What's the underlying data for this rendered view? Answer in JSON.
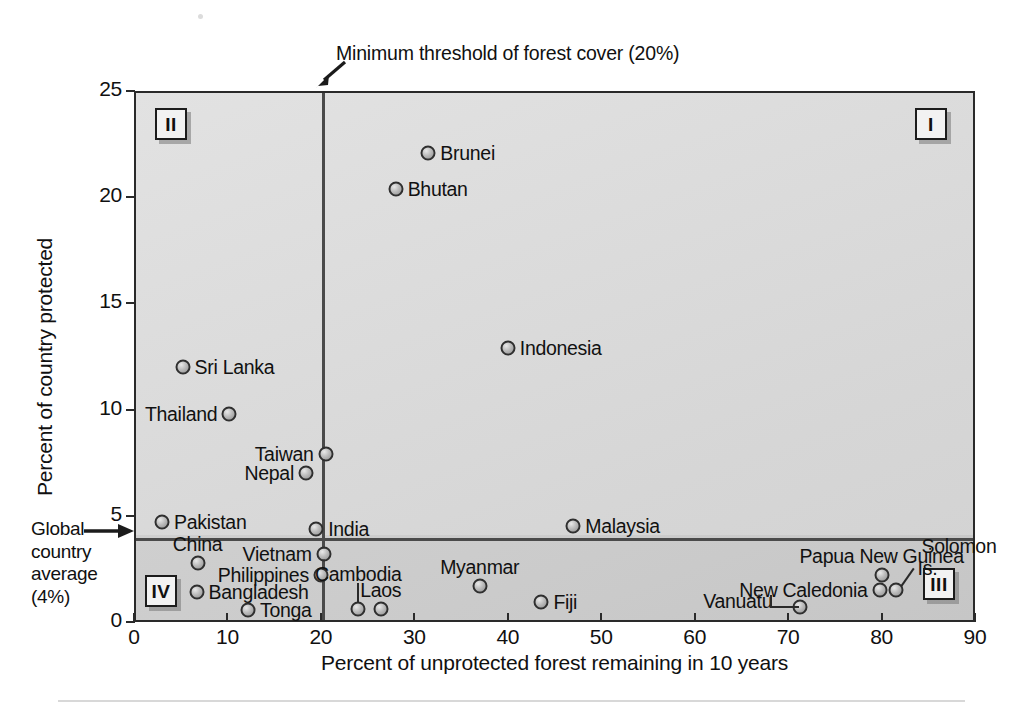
{
  "chart_data": {
    "type": "scatter",
    "title": "",
    "xlabel": "Percent of unprotected forest remaining in 10 years",
    "ylabel": "Percent of country protected",
    "xlim": [
      0,
      90
    ],
    "ylim": [
      0,
      25
    ],
    "xticks": [
      0,
      10,
      20,
      30,
      40,
      50,
      60,
      70,
      80,
      90
    ],
    "yticks": [
      0,
      5,
      10,
      15,
      20,
      25
    ],
    "grid": false,
    "legend": "none",
    "reference_lines": [
      {
        "name": "minimum-threshold-forest-cover",
        "orientation": "vertical",
        "value": 20,
        "label": "Minimum threshold of forest cover (20%)"
      },
      {
        "name": "global-country-average",
        "orientation": "horizontal",
        "value": 4,
        "label": "Global country average (4%)"
      }
    ],
    "quadrants": [
      {
        "id": "I",
        "label": "I"
      },
      {
        "id": "II",
        "label": "II"
      },
      {
        "id": "III",
        "label": "III"
      },
      {
        "id": "IV",
        "label": "IV"
      }
    ],
    "points": [
      {
        "name": "Brunei",
        "x": 31.5,
        "y": 22.1,
        "label_pos": "right"
      },
      {
        "name": "Bhutan",
        "x": 28.0,
        "y": 20.4,
        "label_pos": "right"
      },
      {
        "name": "Indonesia",
        "x": 40.0,
        "y": 12.9,
        "label_pos": "right"
      },
      {
        "name": "Sri Lanka",
        "x": 5.2,
        "y": 12.0,
        "label_pos": "right"
      },
      {
        "name": "Thailand",
        "x": 10.2,
        "y": 9.8,
        "label_pos": "left"
      },
      {
        "name": "Taiwan",
        "x": 20.5,
        "y": 7.9,
        "label_pos": "left"
      },
      {
        "name": "Nepal",
        "x": 18.4,
        "y": 7.0,
        "label_pos": "left"
      },
      {
        "name": "Malaysia",
        "x": 47.0,
        "y": 4.5,
        "label_pos": "right"
      },
      {
        "name": "Pakistan",
        "x": 3.0,
        "y": 4.7,
        "label_pos": "right"
      },
      {
        "name": "India",
        "x": 19.5,
        "y": 4.4,
        "label_pos": "right"
      },
      {
        "name": "China",
        "x": 6.8,
        "y": 2.8,
        "label_pos": "above"
      },
      {
        "name": "Vietnam",
        "x": 20.3,
        "y": 3.2,
        "label_pos": "left"
      },
      {
        "name": "Philippines",
        "x": 20.0,
        "y": 2.2,
        "label_pos": "left"
      },
      {
        "name": "Bangladesh",
        "x": 6.7,
        "y": 1.4,
        "label_pos": "right"
      },
      {
        "name": "Tonga",
        "x": 12.2,
        "y": 0.55,
        "label_pos": "right"
      },
      {
        "name": "Cambodia",
        "x": 24.0,
        "y": 0.6,
        "label_pos": "leader-up"
      },
      {
        "name": "Laos",
        "x": 26.4,
        "y": 0.6,
        "label_pos": "above"
      },
      {
        "name": "Myanmar",
        "x": 37.0,
        "y": 1.7,
        "label_pos": "above"
      },
      {
        "name": "Fiji",
        "x": 43.6,
        "y": 0.95,
        "label_pos": "right"
      },
      {
        "name": "Papua New Guinea",
        "x": 80.0,
        "y": 2.2,
        "label_pos": "above"
      },
      {
        "name": "New Caledonia",
        "x": 79.8,
        "y": 1.5,
        "label_pos": "left"
      },
      {
        "name": "Solomon Is.",
        "x": 81.5,
        "y": 1.5,
        "label_pos": "leader-up-right"
      },
      {
        "name": "Vanuatu",
        "x": 71.3,
        "y": 0.7,
        "label_pos": "leader-left"
      }
    ]
  },
  "axis": {
    "xlabel": "Percent of unprotected forest remaining in 10 years",
    "ylabel": "Percent of country protected",
    "x_tick_labels": [
      "0",
      "10",
      "20",
      "30",
      "40",
      "50",
      "60",
      "70",
      "80",
      "90"
    ],
    "y_tick_labels": [
      "0",
      "5",
      "10",
      "15",
      "20",
      "25"
    ]
  },
  "annotations": {
    "threshold_note": "Minimum threshold of forest cover (20%)",
    "global_average_note": "Global\ncountry\naverage\n(4%)",
    "global_average_lines": [
      "Global",
      "country",
      "average",
      "(4%)"
    ]
  },
  "quadrant_labels": {
    "one": "I",
    "two": "II",
    "three": "III",
    "four": "IV"
  },
  "point_labels": {
    "brunei": "Brunei",
    "bhutan": "Bhutan",
    "indonesia": "Indonesia",
    "sri_lanka": "Sri Lanka",
    "thailand": "Thailand",
    "taiwan": "Taiwan",
    "nepal": "Nepal",
    "malaysia": "Malaysia",
    "pakistan": "Pakistan",
    "india": "India",
    "china": "China",
    "vietnam": "Vietnam",
    "philippines": "Philippines",
    "bangladesh": "Bangladesh",
    "tonga": "Tonga",
    "cambodia": "Cambodia",
    "laos": "Laos",
    "myanmar": "Myanmar",
    "fiji": "Fiji",
    "papua_new_guinea": "Papua New Guinea",
    "new_caledonia": "New Caledonia",
    "solomon_is_line1": "Solomon",
    "solomon_is_line2": "Is.",
    "vanuatu": "Vanuatu"
  },
  "colors": {
    "plot_bg_upper": "#dcdcdc",
    "plot_bg_lower": "#cacaca",
    "axis": "#2a2a2a",
    "reference_line": "#4a4a4a",
    "marker_edge": "#2f2f2f",
    "text": "#101010"
  }
}
